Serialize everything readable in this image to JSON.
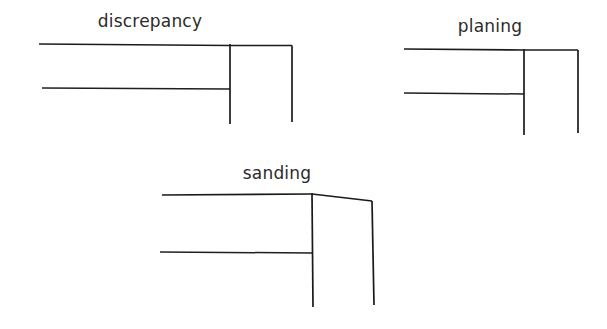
{
  "page": {
    "background_color": "#ffffff",
    "ink_color": "#1a1a1a",
    "width": 607,
    "height": 329
  },
  "figures": [
    {
      "id": "discrepancy",
      "label": "discrepancy",
      "label_x": 150,
      "label_y": 27,
      "strokes": [
        {
          "name": "upper-long-horizontal",
          "points": "39,44 230,45.5"
        },
        {
          "name": "top-right-horizontal",
          "points": "230,45.5 292,45.5"
        },
        {
          "name": "lower-long-horizontal",
          "points": "42,88 230,89"
        },
        {
          "name": "inner-vertical",
          "points": "230,44 230,124"
        },
        {
          "name": "outer-vertical",
          "points": "292,45.5 292,122"
        }
      ]
    },
    {
      "id": "planing",
      "label": "planing",
      "label_x": 490,
      "label_y": 32,
      "strokes": [
        {
          "name": "upper-long-horizontal",
          "points": "404,49 524,50"
        },
        {
          "name": "top-right-horizontal",
          "points": "524,50 578,50"
        },
        {
          "name": "lower-long-horizontal",
          "points": "404,93 524,94"
        },
        {
          "name": "inner-vertical",
          "points": "524,49 524,135"
        },
        {
          "name": "outer-vertical",
          "points": "578,50 578,133"
        }
      ]
    },
    {
      "id": "sanding",
      "label": "sanding",
      "label_x": 277,
      "label_y": 179,
      "strokes": [
        {
          "name": "upper-long-horizontal",
          "points": "162,195 312,194"
        },
        {
          "name": "top-right-sloped",
          "points": "312,194 372,201"
        },
        {
          "name": "lower-long-horizontal",
          "points": "160,252 312,253"
        },
        {
          "name": "inner-vertical",
          "points": "312,193 313,307"
        },
        {
          "name": "outer-vertical",
          "points": "372,201 374,305"
        }
      ]
    }
  ]
}
